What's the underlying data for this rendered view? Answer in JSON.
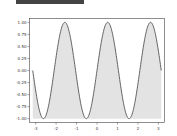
{
  "chart_data": {
    "type": "area",
    "title": "",
    "xlabel": "",
    "ylabel": "",
    "function": "sin(3x)",
    "x_range": [
      -3.14159,
      3.14159
    ],
    "xlim": [
      -3.3,
      3.3
    ],
    "ylim": [
      -1.08,
      1.08
    ],
    "fill": "between curve and -1",
    "x_ticks": [
      "-3",
      "-2",
      "-1",
      "0",
      "1",
      "2",
      "3"
    ],
    "y_ticks": [
      "1.00",
      "0.75",
      "0.50",
      "0.25",
      "0.00",
      "-0.25",
      "-0.50",
      "-0.75",
      "-1.00"
    ],
    "grid": false,
    "colors": {
      "line": "#555555",
      "fill": "#e3e3e3",
      "topbar": "#444444"
    }
  }
}
